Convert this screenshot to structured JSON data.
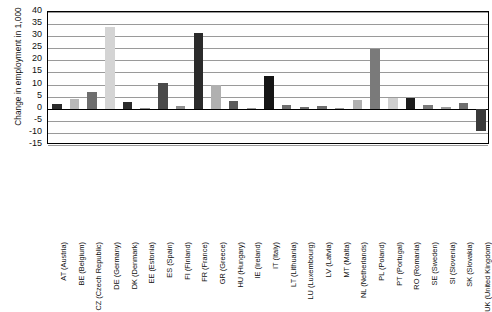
{
  "chart_data": {
    "type": "bar",
    "title": "",
    "xlabel": "",
    "ylabel": "Change in employment in 1,000",
    "ylim": [
      -15,
      40
    ],
    "ytick_step": 5,
    "yticks": [
      "40",
      "35",
      "30",
      "25",
      "20",
      "15",
      "10",
      "5",
      "0",
      "-5",
      "-10",
      "-15"
    ],
    "grid": true,
    "legend": "none",
    "categories": [
      "AT (Austria)",
      "BE (Belgium)",
      "CZ (Czech Republic)",
      "DE (Germany)",
      "DK (Denmark)",
      "EE (Estonia)",
      "ES (Spain)",
      "FI (Finland)",
      "FR (France)",
      "GR (Greece)",
      "HU (Hungary)",
      "IE (Ireland)",
      "IT (Italy)",
      "LT (Lithuania)",
      "LU (Luxembourg)",
      "LV (Latvia)",
      "MT (Malta)",
      "NL (Netherlands)",
      "PL (Poland)",
      "PT (Portugal)",
      "RO (Romania)",
      "SE (Sweden)",
      "SI (Slovenia)",
      "SK (Slovakia)",
      "UK (United Kingdom)"
    ],
    "values": [
      2,
      4.2,
      7,
      34,
      2.7,
      0.5,
      10.5,
      1.3,
      31.4,
      9.8,
      3.2,
      0.2,
      13.6,
      1.5,
      0.7,
      1.1,
      0.1,
      3.7,
      24.8,
      4.6,
      4.6,
      1.6,
      0.8,
      2.2,
      -9.2
    ],
    "bar_colors": [
      "#2b2b2b",
      "#b8b8b8",
      "#6e6e6e",
      "#d4d4d4",
      "#2b2b2b",
      "#8f8f8f",
      "#4a4a4a",
      "#8f8f8f",
      "#2b2b2b",
      "#b0b0b0",
      "#5c5c5c",
      "#9a9a9a",
      "#151515",
      "#6e6e6e",
      "#6e6e6e",
      "#6e6e6e",
      "#9a9a9a",
      "#b0b0b0",
      "#7a7a7a",
      "#cfcfcf",
      "#1c1c1c",
      "#7a7a7a",
      "#9a9a9a",
      "#6e6e6e",
      "#3a3a3a"
    ]
  },
  "axis": {
    "y_axis_title": "Change in employment in 1,000"
  }
}
